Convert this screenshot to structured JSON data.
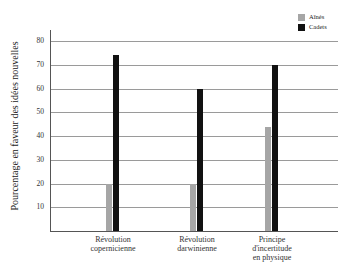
{
  "chart_data": {
    "type": "bar",
    "title": "",
    "xlabel": "",
    "ylabel": "Pourcentage en faveur des idées nouvelles",
    "ylim": [
      0,
      80
    ],
    "yticks": [
      10,
      20,
      30,
      40,
      50,
      60,
      70,
      80
    ],
    "grid": true,
    "legend_position": "top-right",
    "categories": [
      "Révolution copernicienne",
      "Révolution darwinienne",
      "Principe d'incertitude en physique"
    ],
    "category_lines": [
      [
        "Révolution",
        "copernicienne"
      ],
      [
        "Révolution",
        "darwinienne"
      ],
      [
        "Principe",
        "d'incertitude",
        "en physique"
      ]
    ],
    "series": [
      {
        "name": "Aînés",
        "color": "#a6a6a6",
        "values": [
          20,
          20,
          44
        ]
      },
      {
        "name": "Cadets",
        "color": "#111111",
        "values": [
          74,
          60,
          70
        ]
      }
    ]
  }
}
